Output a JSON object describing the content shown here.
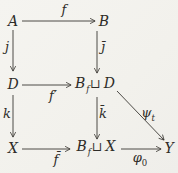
{
  "diagram": {
    "colors": {
      "ink": "#3a3833",
      "paper": "#f4f3ef"
    },
    "nodes": {
      "A": "A",
      "B": "B",
      "D": "D",
      "X": "X",
      "Y": "Y",
      "BfD": {
        "left": "B",
        "sub": "f",
        "op": "⊔",
        "right": "D"
      },
      "BfX": {
        "left": "B",
        "sub": "f",
        "op": "⊔",
        "right": "X"
      }
    },
    "edges": {
      "f": {
        "label": "f"
      },
      "j": {
        "label": "j"
      },
      "jbar": {
        "label": "j̄"
      },
      "fprime": {
        "label": "f′"
      },
      "k": {
        "label": "k"
      },
      "kbar": {
        "label": "k̄"
      },
      "fbar": {
        "label": "f̄"
      },
      "phi": {
        "main": "φ",
        "sub": "0"
      },
      "psi": {
        "main": "ψ",
        "sub": "t"
      }
    }
  }
}
